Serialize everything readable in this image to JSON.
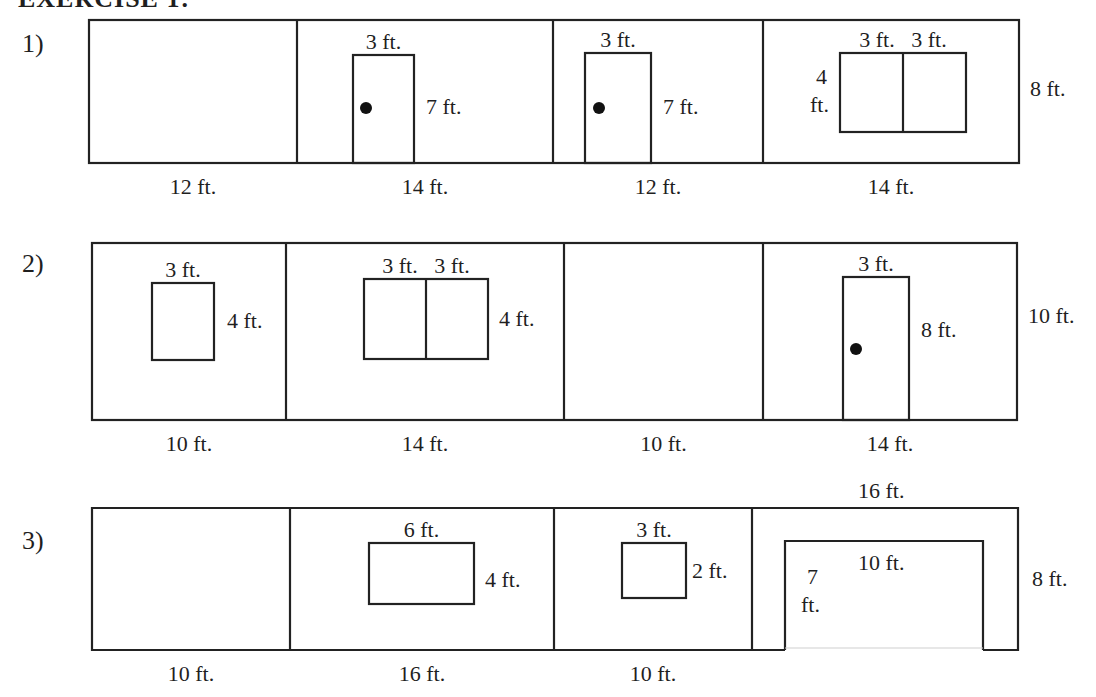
{
  "header": {
    "title": "EXERCISE 1:"
  },
  "stroke_color": "#222222",
  "exercises": [
    {
      "label": "1)",
      "label_pos": [
        22,
        52
      ],
      "box": {
        "x": 89,
        "y": 20,
        "w": 930,
        "h": 143
      },
      "walls": [
        {
          "x0": 89,
          "x1": 297,
          "bottom_label": "12 ft.",
          "features": []
        },
        {
          "x0": 297,
          "x1": 553,
          "bottom_label": "14 ft.",
          "features": [
            {
              "type": "door",
              "x": 353,
              "y": 55,
              "w": 61,
              "h": 108,
              "knob": [
                366,
                108
              ],
              "top_label": "3 ft.",
              "side_label": "7 ft.",
              "side_pos": [
                426,
                114
              ]
            }
          ]
        },
        {
          "x0": 553,
          "x1": 763,
          "bottom_label": "12 ft.",
          "features": [
            {
              "type": "door",
              "x": 585,
              "y": 53,
              "w": 66,
              "h": 110,
              "knob": [
                599,
                108
              ],
              "top_label": "3 ft.",
              "side_label": "7 ft.",
              "side_pos": [
                663,
                114
              ]
            }
          ]
        },
        {
          "x0": 763,
          "x1": 1019,
          "bottom_label": "14 ft.",
          "features": [
            {
              "type": "double-window",
              "x": 840,
              "y": 53,
              "w": 126,
              "h": 79,
              "top_label": "3 ft.   3 ft.",
              "side_label_lines": [
                "4",
                "ft."
              ],
              "side_pos": [
                820,
                84
              ]
            }
          ]
        }
      ],
      "height_label": "8 ft.",
      "height_pos": [
        1030,
        96
      ]
    },
    {
      "label": "2)",
      "label_pos": [
        22,
        272
      ],
      "box": {
        "x": 92,
        "y": 243,
        "w": 925,
        "h": 177
      },
      "walls": [
        {
          "x0": 92,
          "x1": 286,
          "bottom_label": "10 ft.",
          "features": [
            {
              "type": "window",
              "x": 152,
              "y": 283,
              "w": 62,
              "h": 77,
              "top_label": "3 ft.",
              "side_label": "4 ft.",
              "side_pos": [
                227,
                328
              ]
            }
          ]
        },
        {
          "x0": 286,
          "x1": 564,
          "bottom_label": "14 ft.",
          "features": [
            {
              "type": "double-window",
              "x": 364,
              "y": 279,
              "w": 124,
              "h": 80,
              "top_label": "3 ft.   3 ft.",
              "side_label": "4 ft.",
              "side_pos": [
                499,
                326
              ]
            }
          ]
        },
        {
          "x0": 564,
          "x1": 763,
          "bottom_label": "10 ft.",
          "features": []
        },
        {
          "x0": 763,
          "x1": 1017,
          "bottom_label": "14 ft.",
          "features": [
            {
              "type": "door",
              "x": 843,
              "y": 277,
              "w": 66,
              "h": 143,
              "knob": [
                856,
                349
              ],
              "top_label": "3 ft.",
              "side_label": "8 ft.",
              "side_pos": [
                921,
                337
              ]
            }
          ]
        }
      ],
      "height_label": "10 ft.",
      "height_pos": [
        1028,
        323
      ]
    },
    {
      "label": "3)",
      "label_pos": [
        22,
        549
      ],
      "box": {
        "x": 92,
        "y": 508,
        "w": 926,
        "h": 142
      },
      "walls": [
        {
          "x0": 92,
          "x1": 290,
          "bottom_label": "10 ft.",
          "features": []
        },
        {
          "x0": 290,
          "x1": 554,
          "bottom_label": "16 ft.",
          "features": [
            {
              "type": "window",
              "x": 369,
              "y": 543,
              "w": 105,
              "h": 61,
              "top_label": "6 ft.",
              "side_label": "4 ft.",
              "side_pos": [
                485,
                587
              ]
            }
          ]
        },
        {
          "x0": 554,
          "x1": 752,
          "bottom_label": "10 ft.",
          "features": [
            {
              "type": "window",
              "x": 622,
              "y": 543,
              "w": 64,
              "h": 55,
              "top_label": "3 ft.",
              "side_label": "2 ft.",
              "side_pos": [
                692,
                578
              ]
            }
          ]
        },
        {
          "x0": 752,
          "x1": 1018,
          "bottom_label": "",
          "features": [
            {
              "type": "garage-door",
              "x": 785,
              "y": 541,
              "w": 198,
              "h": 109,
              "top_label": "",
              "inner_label": "10 ft.",
              "inner_pos": [
                858,
                570
              ],
              "side_label_lines": [
                "7",
                "ft."
              ],
              "side_pos": [
                797,
                584
              ]
            }
          ]
        }
      ],
      "top_width_label": "16 ft.",
      "top_width_pos": [
        858,
        498
      ],
      "height_label": "8 ft.",
      "height_pos": [
        1032,
        586
      ]
    }
  ]
}
